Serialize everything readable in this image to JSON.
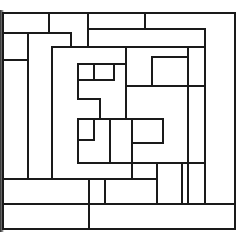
{
  "diagram": {
    "type": "line-partition-layout",
    "stroke_color": "#1a1a1a",
    "background": "#ffffff",
    "stroke_width": 2,
    "outer_frame": {
      "x1": 3,
      "y1": 13,
      "x2": 235,
      "y2": 229
    },
    "segments": [
      {
        "x1": 3,
        "y1": 33,
        "x2": 71,
        "y2": 33
      },
      {
        "x1": 49,
        "y1": 13,
        "x2": 49,
        "y2": 33
      },
      {
        "x1": 71,
        "y1": 33,
        "x2": 71,
        "y2": 47
      },
      {
        "x1": 88,
        "y1": 13,
        "x2": 88,
        "y2": 47
      },
      {
        "x1": 145,
        "y1": 13,
        "x2": 145,
        "y2": 29
      },
      {
        "x1": 88,
        "y1": 29,
        "x2": 205,
        "y2": 29
      },
      {
        "x1": 205,
        "y1": 29,
        "x2": 205,
        "y2": 204
      },
      {
        "x1": 3,
        "y1": 60,
        "x2": 28,
        "y2": 60
      },
      {
        "x1": 28,
        "y1": 33,
        "x2": 28,
        "y2": 179
      },
      {
        "x1": 52,
        "y1": 47,
        "x2": 205,
        "y2": 47
      },
      {
        "x1": 52,
        "y1": 47,
        "x2": 52,
        "y2": 179
      },
      {
        "x1": 188,
        "y1": 47,
        "x2": 188,
        "y2": 204
      },
      {
        "x1": 126,
        "y1": 47,
        "x2": 126,
        "y2": 119
      },
      {
        "x1": 78,
        "y1": 64,
        "x2": 126,
        "y2": 64
      },
      {
        "x1": 78,
        "y1": 64,
        "x2": 78,
        "y2": 99
      },
      {
        "x1": 94,
        "y1": 64,
        "x2": 94,
        "y2": 80
      },
      {
        "x1": 114,
        "y1": 64,
        "x2": 114,
        "y2": 80
      },
      {
        "x1": 78,
        "y1": 80,
        "x2": 114,
        "y2": 80
      },
      {
        "x1": 78,
        "y1": 99,
        "x2": 100,
        "y2": 99
      },
      {
        "x1": 100,
        "y1": 99,
        "x2": 100,
        "y2": 119
      },
      {
        "x1": 152,
        "y1": 57,
        "x2": 188,
        "y2": 57
      },
      {
        "x1": 152,
        "y1": 57,
        "x2": 152,
        "y2": 86
      },
      {
        "x1": 126,
        "y1": 86,
        "x2": 205,
        "y2": 86
      },
      {
        "x1": 78,
        "y1": 119,
        "x2": 163,
        "y2": 119
      },
      {
        "x1": 78,
        "y1": 119,
        "x2": 78,
        "y2": 163
      },
      {
        "x1": 94,
        "y1": 119,
        "x2": 94,
        "y2": 140
      },
      {
        "x1": 78,
        "y1": 140,
        "x2": 94,
        "y2": 140
      },
      {
        "x1": 110,
        "y1": 119,
        "x2": 110,
        "y2": 163
      },
      {
        "x1": 132,
        "y1": 119,
        "x2": 132,
        "y2": 179
      },
      {
        "x1": 163,
        "y1": 119,
        "x2": 163,
        "y2": 143
      },
      {
        "x1": 132,
        "y1": 143,
        "x2": 163,
        "y2": 143
      },
      {
        "x1": 78,
        "y1": 163,
        "x2": 205,
        "y2": 163
      },
      {
        "x1": 157,
        "y1": 163,
        "x2": 157,
        "y2": 204
      },
      {
        "x1": 182,
        "y1": 163,
        "x2": 182,
        "y2": 204
      },
      {
        "x1": 3,
        "y1": 179,
        "x2": 157,
        "y2": 179
      },
      {
        "x1": 89,
        "y1": 179,
        "x2": 89,
        "y2": 229
      },
      {
        "x1": 105,
        "y1": 179,
        "x2": 105,
        "y2": 204
      },
      {
        "x1": 3,
        "y1": 204,
        "x2": 235,
        "y2": 204
      }
    ]
  }
}
